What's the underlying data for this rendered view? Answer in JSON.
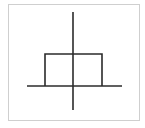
{
  "diagram": {
    "type": "rectangular-pulse",
    "colors": {
      "background": "#ffffff",
      "frame": "#cfcfcf",
      "stroke": "#2b2b2b"
    },
    "frame": {
      "x": 8,
      "y": 4,
      "width": 132,
      "height": 117
    },
    "axes": {
      "horizontal": {
        "x1": 27,
        "y1": 86,
        "x2": 122,
        "y2": 86
      },
      "vertical": {
        "x1": 73,
        "y1": 12,
        "x2": 73,
        "y2": 110
      }
    },
    "pulse": {
      "left_x": 45,
      "right_x": 102,
      "top_y": 54,
      "baseline_y": 86
    },
    "labels": []
  }
}
